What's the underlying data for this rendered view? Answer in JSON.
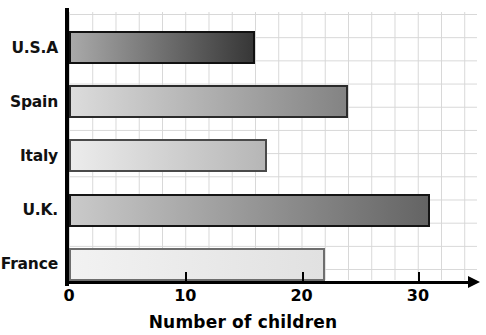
{
  "chart_data": {
    "type": "bar",
    "orientation": "horizontal",
    "title": "",
    "xlabel": "Number of children",
    "ylabel": "",
    "categories": [
      "U.S.A",
      "Spain",
      "Italy",
      "U.K.",
      "France"
    ],
    "values": [
      16,
      24,
      17,
      31,
      22
    ],
    "xlim": [
      0,
      34
    ],
    "xticks": [
      "0",
      "10",
      "20",
      "30"
    ],
    "xtick_values": [
      0,
      10,
      20,
      30
    ],
    "grid": true,
    "legend": "none",
    "bars": [
      {
        "category": "U.S.A",
        "value": 16,
        "gradient_from": "#a9a9a9",
        "gradient_to": "#373737",
        "border": "#111111"
      },
      {
        "category": "Spain",
        "value": 24,
        "gradient_from": "#dcdcdc",
        "gradient_to": "#838383",
        "border": "#2b2b2b"
      },
      {
        "category": "Italy",
        "value": 17,
        "gradient_from": "#ececec",
        "gradient_to": "#b6b6b6",
        "border": "#4a4a4a"
      },
      {
        "category": "U.K.",
        "value": 31,
        "gradient_from": "#cacaca",
        "gradient_to": "#646464",
        "border": "#151515"
      },
      {
        "category": "France",
        "value": 22,
        "gradient_from": "#f2f2f2",
        "gradient_to": "#e1e1e1",
        "border": "#6e6e6e"
      }
    ]
  },
  "axis": {
    "x_title": "Number of children",
    "tick_0": "0",
    "tick_10": "10",
    "tick_20": "20",
    "tick_30": "30"
  },
  "categories": {
    "usa": "U.S.A",
    "spain": "Spain",
    "italy": "Italy",
    "uk": "U.K.",
    "france": "France"
  },
  "colors": {
    "axis": "#000000",
    "gridline": "#d7d7d7",
    "background": "#ffffff",
    "text": "#111111"
  }
}
